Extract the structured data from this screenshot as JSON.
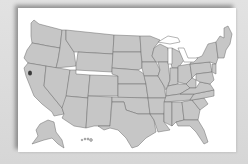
{
  "map": {
    "title": "",
    "region": "United States",
    "style": "blank state outline map",
    "colors": {
      "background": "#dcdcdc",
      "card": "#ffffff",
      "state_fill": "#c6c6c6",
      "state_border": "#6a6a6a",
      "marker": "#3a3a3a"
    },
    "marker": {
      "label": "",
      "approx_location": "San Francisco Bay Area, California"
    },
    "insets": [
      "Alaska",
      "Hawaii"
    ]
  }
}
